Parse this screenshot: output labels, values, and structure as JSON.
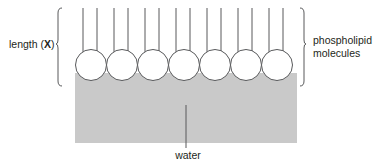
{
  "figure": {
    "background_color": "#ffffff",
    "line_color": "#58595b",
    "text_color": "#231f20",
    "water_fill_color": "#c9c9c9",
    "head_fill_color": "#ffffff"
  },
  "labels": {
    "length_prefix": "length (",
    "length_variable": "X",
    "length_suffix": ")",
    "phospholipid": "phospholipid molecules",
    "water": "water"
  },
  "diagram_data": {
    "type": "diagram",
    "molecule_count": 7,
    "tails_per_molecule": 2,
    "head_diameter_px": 31,
    "head_center_y_px": 65,
    "head_center_x_px": [
      91,
      122,
      153,
      184,
      215,
      246,
      277
    ],
    "tail_top_y_px": 8,
    "tail_bottom_y_px": 52,
    "tail_offsets_px": [
      -8,
      6
    ],
    "water_rect": {
      "x": 75,
      "y": 73,
      "width": 222,
      "height": 70
    },
    "left_brace": {
      "x": 62,
      "top": 8,
      "bottom": 86,
      "tip_y": 45
    },
    "right_brace": {
      "x": 300,
      "top": 8,
      "bottom": 86,
      "tip_y": 45
    },
    "water_leader_line": {
      "x": 186,
      "top": 105,
      "bottom": 148
    }
  }
}
